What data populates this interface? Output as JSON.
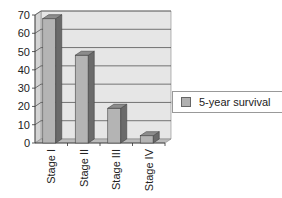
{
  "chart_data": {
    "type": "bar",
    "title": "",
    "xlabel": "",
    "ylabel": "",
    "categories": [
      "Stage I",
      "Stage II",
      "Stage III",
      "Stage IV"
    ],
    "series": [
      {
        "name": "5-year survival",
        "values": [
          68,
          48,
          19,
          4
        ]
      }
    ],
    "ylim": [
      0,
      70
    ],
    "yticks": [
      0,
      10,
      20,
      30,
      40,
      50,
      60,
      70
    ],
    "grid": true,
    "legend_position": "right",
    "style": "3d-column"
  },
  "legend": {
    "label": "5-year survival"
  },
  "colors": {
    "bar_front": "#b4b4b4",
    "bar_side": "#6a6a6a",
    "bar_top": "#8c8c8c",
    "plot_bg": "#e6e6e6",
    "grid": "#555555"
  }
}
